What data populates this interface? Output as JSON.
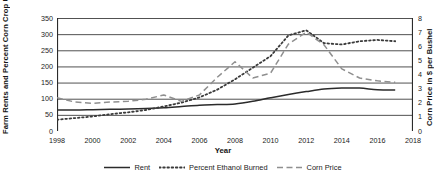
{
  "chart_data": {
    "type": "line",
    "title": "",
    "xlabel": "Year",
    "ylabel": "Farm Rents and Percent Corn Crop Used for Ethanol",
    "y2label": "Corn Price in $ per Bushel",
    "grid": true,
    "legend_position": "bottom",
    "xlim": [
      1998,
      2018
    ],
    "ylim": [
      0,
      350
    ],
    "y2lim": [
      0,
      8
    ],
    "xticks": [
      1998,
      2000,
      2002,
      2004,
      2006,
      2008,
      2010,
      2012,
      2014,
      2016,
      2018
    ],
    "xtick_labels": [
      "1998",
      "2000",
      "2002",
      "2004",
      "2006",
      "2008",
      "2010",
      "2012",
      "2014",
      "2016",
      "2018"
    ],
    "yticks": [
      0,
      50,
      100,
      150,
      200,
      250,
      300,
      350
    ],
    "ytick_labels": [
      "0",
      "50",
      "100",
      "150",
      "200",
      "250",
      "300",
      "350"
    ],
    "y2ticks": [
      0,
      1,
      2,
      3,
      4,
      5,
      6,
      7,
      8
    ],
    "y2tick_labels": [
      "0",
      "1",
      "2",
      "3",
      "4",
      "5",
      "6",
      "7",
      "8"
    ],
    "x": [
      1998,
      1999,
      2000,
      2001,
      2002,
      2003,
      2004,
      2005,
      2006,
      2007,
      2008,
      2009,
      2010,
      2011,
      2012,
      2013,
      2014,
      2015,
      2016,
      2017
    ],
    "series": [
      {
        "name": "Rent",
        "axis": "left",
        "style": "solid",
        "color": "#2b2b2b",
        "values": [
          65,
          65,
          66,
          67,
          68,
          70,
          72,
          76,
          80,
          82,
          84,
          92,
          103,
          113,
          122,
          130,
          133,
          133,
          128,
          127
        ]
      },
      {
        "name": "Percent Ethanol Burned",
        "axis": "left",
        "style": "dotted",
        "color": "#3a3a3a",
        "values": [
          35,
          40,
          45,
          52,
          58,
          65,
          76,
          88,
          104,
          128,
          160,
          196,
          232,
          296,
          312,
          272,
          268,
          278,
          282,
          278
        ]
      },
      {
        "name": "Corn Price",
        "axis": "right",
        "style": "dashed",
        "color": "#8f8f8f",
        "values": [
          2.35,
          2.05,
          1.95,
          2.05,
          2.1,
          2.25,
          2.55,
          2.1,
          2.55,
          3.8,
          4.9,
          3.75,
          4.1,
          6.15,
          7.0,
          6.1,
          4.4,
          3.75,
          3.55,
          3.45
        ]
      }
    ]
  },
  "legend": {
    "items": [
      {
        "label": "Rent"
      },
      {
        "label": "Percent Ethanol Burned"
      },
      {
        "label": "Corn Price"
      }
    ]
  }
}
